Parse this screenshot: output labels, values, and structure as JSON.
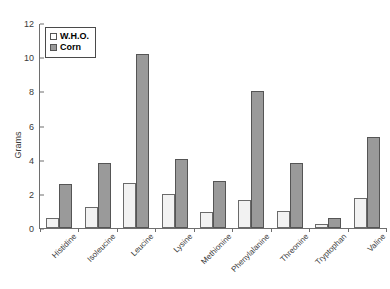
{
  "chart_data": {
    "type": "bar",
    "title": "",
    "xlabel": "",
    "ylabel": "Grams",
    "ylim": [
      0,
      12
    ],
    "yticks": [
      0,
      2,
      4,
      6,
      8,
      10,
      12
    ],
    "grid": false,
    "legend_position": "top-left",
    "categories": [
      "Histidine",
      "Isoleucine",
      "Leucine",
      "Lysine",
      "Methionine",
      "Phenylalanine",
      "Threonine",
      "Tryptophan",
      "Valine"
    ],
    "series": [
      {
        "name": "W.H.O.",
        "color": "#f2f2f2",
        "values": [
          0.6,
          1.25,
          2.65,
          2.0,
          0.95,
          1.65,
          1.0,
          0.25,
          1.75
        ]
      },
      {
        "name": "Corn",
        "color": "#9a9a9a",
        "values": [
          2.6,
          3.8,
          10.2,
          4.05,
          2.75,
          8.0,
          3.8,
          0.6,
          5.35
        ]
      }
    ]
  }
}
